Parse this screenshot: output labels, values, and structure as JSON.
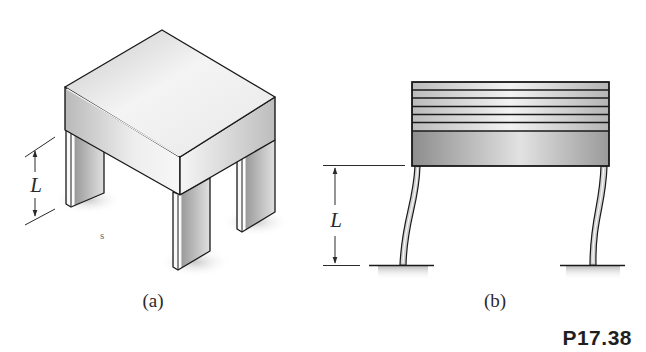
{
  "figure": {
    "problem_number": "P17.38",
    "panels": [
      {
        "id": "a",
        "caption": "(a)",
        "description": "Isometric view of a rigid block (table top) supported by four rectangular legs",
        "dimension_label": "L"
      },
      {
        "id": "b",
        "caption": "(b)",
        "description": "Side view showing layered top slab on two flexible columns deflected sideways, fixed to ground",
        "dimension_label": "L"
      }
    ],
    "stray_mark": "s",
    "colors": {
      "outline": "#1a1a1a",
      "face_light": "#f2f2f2",
      "face_mid": "#d4d4d4",
      "face_dark": "#9a9a9a",
      "shadow": "#cfcfcf"
    }
  }
}
